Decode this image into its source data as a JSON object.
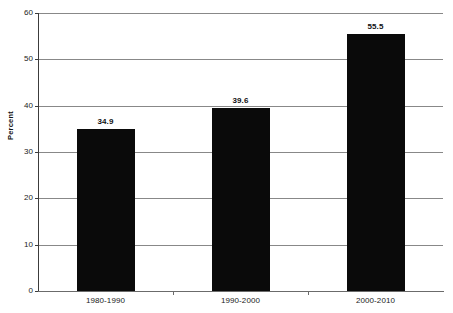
{
  "chart_data": {
    "type": "bar",
    "title": "",
    "subtitle": "",
    "xlabel": "",
    "ylabel": "Percent",
    "categories": [
      "1980-1990",
      "1990-2000",
      "2000-2010"
    ],
    "values": [
      34.9,
      39.6,
      55.5
    ],
    "value_labels": [
      "34.9",
      "39.6",
      "55.5"
    ],
    "ylim": [
      0,
      60
    ],
    "ytick_values": [
      0,
      10,
      20,
      30,
      40,
      50,
      60
    ],
    "ytick_labels": [
      "0",
      "10",
      "20",
      "30",
      "40",
      "50",
      "60"
    ],
    "grid": true,
    "grid_axis": "y",
    "legend": false,
    "legend_position": "none",
    "bar_color": "#0a0a0a",
    "grid_color": "#888888",
    "axis_color": "#3c3c3c",
    "text_color": "#111111",
    "background_color": "#ffffff"
  }
}
